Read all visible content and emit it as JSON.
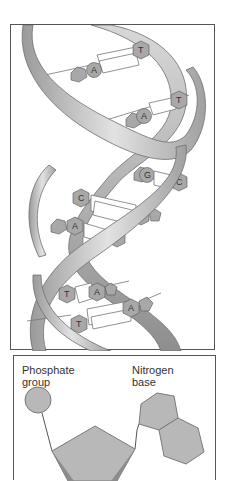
{
  "helix": {
    "title": "DNA double helix",
    "base_pairs": [
      {
        "left": "A",
        "right": "T"
      },
      {
        "left": "A",
        "right": "T"
      },
      {
        "left": "G",
        "right": "C"
      },
      {
        "left": "C",
        "right": "G"
      },
      {
        "left": "A",
        "right": "T"
      },
      {
        "left": "T",
        "right": "A"
      },
      {
        "left": "T",
        "right": "A"
      }
    ],
    "colors": {
      "strand_light": "#d9d9d9",
      "strand_dark": "#8c8c8c",
      "base": "#a8a8a8",
      "outline": "#555555"
    }
  },
  "nucleotide": {
    "phosphate_label_line1": "Phosphate",
    "phosphate_label_line2": "group",
    "base_label_line1": "Nitrogen",
    "base_label_line2": "base",
    "colors": {
      "shape_fill": "#b8b8b8",
      "shape_stroke": "#7a7a7a"
    }
  }
}
